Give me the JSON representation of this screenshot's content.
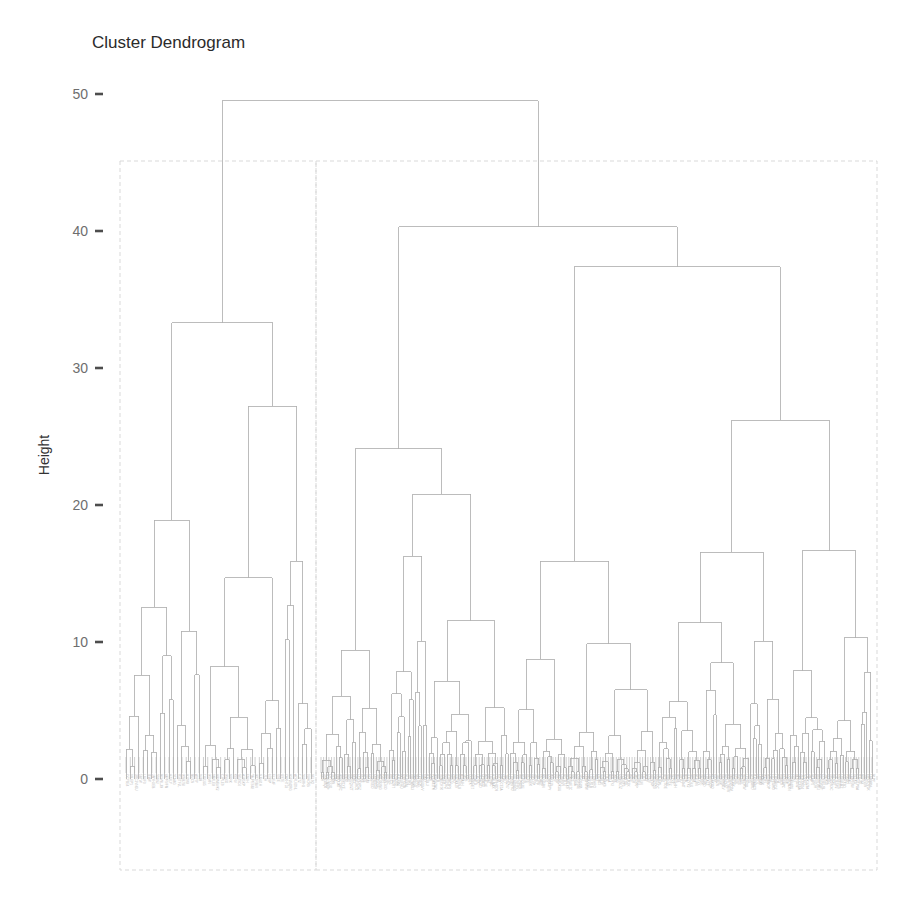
{
  "figure": {
    "title": "Cluster Dendrogram",
    "width": 911,
    "height": 899,
    "background_color": "#ffffff"
  },
  "axis": {
    "y_title": "Height",
    "y_ticks": [
      "0",
      "10",
      "20",
      "30",
      "40",
      "50"
    ],
    "y_tick_values": [
      0,
      10,
      20,
      30,
      40,
      50
    ],
    "tick_mark_color": "#4d4d4d",
    "tick_label_color": "#6e6e6e"
  },
  "panel": {
    "border_style": "dashed",
    "border_color": "#d9d9d9",
    "panels": [
      {
        "name": "left-panel",
        "x0": 120,
        "x1": 316,
        "y0": 161,
        "y1": 870
      },
      {
        "name": "right-panel",
        "x0": 316,
        "x1": 877,
        "y0": 161,
        "y1": 870
      }
    ]
  },
  "chart_data": {
    "type": "dendrogram",
    "title": "Cluster Dendrogram",
    "xlabel": "",
    "ylabel": "Height",
    "ylim": [
      0,
      50
    ],
    "yticks": [
      0,
      10,
      20,
      30,
      40,
      50
    ],
    "grid": false,
    "legend": "none",
    "n_leaves": 300,
    "link_color": "#b0b0b0",
    "root_height": 49.5,
    "major_merges": [
      {
        "name": "root",
        "height": 49.5,
        "left_child_x": 185,
        "right_child_x": 562
      },
      {
        "name": "left-cluster-root",
        "height": 33.3,
        "left_child_x": 163,
        "right_child_x": 232
      },
      {
        "name": "right-cluster-root",
        "height": 40.3,
        "left_child_x": 410,
        "right_child_x": 745
      },
      {
        "name": "right-A",
        "height": 24.1,
        "left_child_x": 336,
        "right_child_x": 485
      },
      {
        "name": "right-B",
        "height": 20.8,
        "left_child_x": 430,
        "right_child_x": 540
      },
      {
        "name": "right-C",
        "height": 37.4,
        "left_child_x": 650,
        "right_child_x": 840
      },
      {
        "name": "right-D",
        "height": 26.2,
        "left_child_x": 718,
        "right_child_x": 810
      },
      {
        "name": "left-sub1",
        "height": 27.2,
        "left_child_x": 205,
        "right_child_x": 262
      },
      {
        "name": "left-sub2",
        "height": 19.8,
        "left_child_x": 238,
        "right_child_x": 282
      },
      {
        "name": "left-sub3",
        "height": 18.9,
        "left_child_x": 148,
        "right_child_x": 180
      },
      {
        "name": "left-sub4",
        "height": 17.8,
        "left_child_x": 252,
        "right_child_x": 272
      },
      {
        "name": "right-E",
        "height": 17.7,
        "left_child_x": 500,
        "right_child_x": 560
      },
      {
        "name": "right-F",
        "height": 17.1,
        "left_child_x": 790,
        "right_child_x": 855
      },
      {
        "name": "right-G",
        "height": 15.9,
        "left_child_x": 630,
        "right_child_x": 660
      },
      {
        "name": "right-H",
        "height": 14.6,
        "left_child_x": 400,
        "right_child_x": 460
      },
      {
        "name": "right-I",
        "height": 13.6,
        "left_child_x": 562,
        "right_child_x": 596
      },
      {
        "name": "right-J",
        "height": 12.6,
        "left_child_x": 690,
        "right_child_x": 735
      }
    ],
    "random_seed": 20240607
  }
}
